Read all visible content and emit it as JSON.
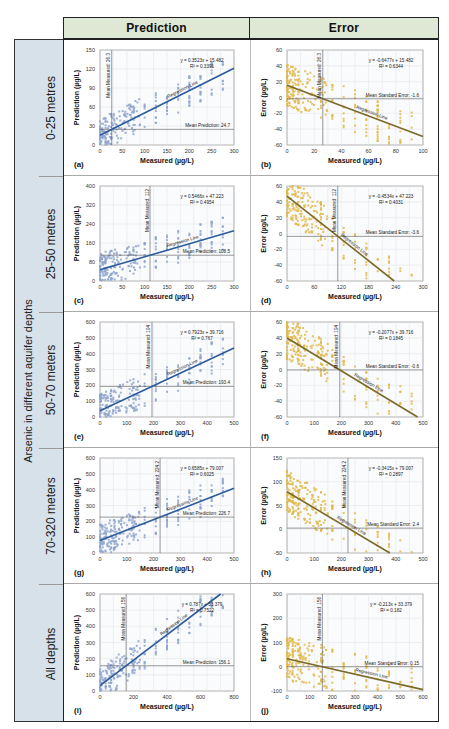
{
  "header": {
    "col1": "Prediction",
    "col2": "Error"
  },
  "sidebar": {
    "title": "Arsenic in different aquifer depths",
    "rows": [
      "0-25 metres",
      "25-50 metres",
      "50-70 meters",
      "70-320 meters",
      "All depths"
    ]
  },
  "chart_data": [
    {
      "panel": "(a)",
      "type": "scatter",
      "depth": "0-25 metres",
      "kind": "prediction",
      "xlabel": "Measured (µg/L)",
      "ylabel": "Prediction (µg/L)",
      "xlim": [
        0,
        300
      ],
      "ylim": [
        0,
        150
      ],
      "xticks": [
        0,
        50,
        100,
        150,
        200,
        250,
        300
      ],
      "yticks": [
        0,
        30,
        60,
        90,
        120,
        150
      ],
      "equation": "y = 0.3523x + 15.482",
      "r2": "R² = 0.3391",
      "slope": 0.3523,
      "intercept": 15.482,
      "mean_x_label": "Mean Measured: 26.3",
      "mean_x": 26.3,
      "mean_y_label": "Mean Prediction: 24.7",
      "mean_y": 24.7,
      "line_label": "Regression Line",
      "color": "#2e5b9a",
      "point_color": "#8ea5cc"
    },
    {
      "panel": "(b)",
      "type": "scatter",
      "depth": "0-25 metres",
      "kind": "error",
      "xlabel": "Measured (µg/L)",
      "ylabel": "Error (µg/L)",
      "xlim": [
        0,
        100
      ],
      "ylim": [
        -60,
        60
      ],
      "xticks": [
        0,
        20,
        40,
        60,
        80,
        100
      ],
      "yticks": [
        -60,
        -40,
        -20,
        0,
        20,
        40,
        60
      ],
      "equation": "y = -0.6477x + 15.482",
      "r2": "R² = 0.6344",
      "slope": -0.6477,
      "intercept": 15.482,
      "mean_x_label": "Mean Measured: 26.3",
      "mean_x": 26.3,
      "mean_y_label": "Mean Standard Error: -1.6",
      "mean_y": -1.6,
      "line_label": "Regression Line",
      "color": "#7a6a2a",
      "point_color": "#e0b94a"
    },
    {
      "panel": "(c)",
      "type": "scatter",
      "depth": "25-50 metres",
      "kind": "prediction",
      "xlabel": "Measured (µg/L)",
      "ylabel": "Prediction (µg/L)",
      "xlim": [
        0,
        300
      ],
      "ylim": [
        0,
        400
      ],
      "xticks": [
        0,
        50,
        100,
        150,
        200,
        250,
        300
      ],
      "yticks": [
        0,
        80,
        160,
        240,
        320,
        400
      ],
      "equation": "y = 0.5466x + 47.223",
      "r2": "R² = 0.4954",
      "slope": 0.5466,
      "intercept": 47.223,
      "mean_x_label": "Mean Measured: 112",
      "mean_x": 112,
      "mean_y_label": "Mean Prediction: 108.5",
      "mean_y": 108.5,
      "line_label": "Regression Line",
      "color": "#2e5b9a",
      "point_color": "#8ea5cc"
    },
    {
      "panel": "(d)",
      "type": "scatter",
      "depth": "25-50 metres",
      "kind": "error",
      "xlabel": "Measured (µg/L)",
      "ylabel": "Error (µg/L)",
      "xlim": [
        0,
        300
      ],
      "ylim": [
        -60,
        60
      ],
      "xticks": [
        0,
        60,
        120,
        180,
        240,
        300
      ],
      "yticks": [
        -60,
        -40,
        -20,
        0,
        20,
        40,
        60
      ],
      "equation": "y = -0.4534x + 47.223",
      "r2": "R² = 0.4031",
      "slope": -0.4534,
      "intercept": 47.223,
      "mean_x_label": "Mean Measured: 112",
      "mean_x": 112,
      "mean_y_label": "Mean Standard Error: -3.6",
      "mean_y": -3.6,
      "line_label": "Regression Line",
      "color": "#7a6a2a",
      "point_color": "#e0b94a"
    },
    {
      "panel": "(e)",
      "type": "scatter",
      "depth": "50-70 meters",
      "kind": "prediction",
      "xlabel": "Measured (µg/L)",
      "ylabel": "Prediction (µg/L)",
      "xlim": [
        0,
        500
      ],
      "ylim": [
        0,
        600
      ],
      "xticks": [
        0,
        100,
        200,
        300,
        400,
        500
      ],
      "yticks": [
        0,
        100,
        200,
        300,
        400,
        500,
        600
      ],
      "equation": "y = 0.7923x + 39.716",
      "r2": "R² = 0.767",
      "slope": 0.7923,
      "intercept": 39.716,
      "mean_x_label": "Mean Measured: 194",
      "mean_x": 194,
      "mean_y_label": "Mean Prediction: 193.4",
      "mean_y": 193.4,
      "line_label": "Regression Line",
      "color": "#2e5b9a",
      "point_color": "#8ea5cc"
    },
    {
      "panel": "(f)",
      "type": "scatter",
      "depth": "50-70 meters",
      "kind": "error",
      "xlabel": "Measured (µg/L)",
      "ylabel": "Error (µg/L)",
      "xlim": [
        0,
        500
      ],
      "ylim": [
        -60,
        60
      ],
      "xticks": [
        0,
        100,
        200,
        300,
        400,
        500
      ],
      "yticks": [
        -60,
        -40,
        -20,
        0,
        20,
        40,
        60
      ],
      "equation": "y = -0.2077x + 39.716",
      "r2": "R² = 0.1845",
      "slope": -0.2077,
      "intercept": 39.716,
      "mean_x_label": "Mean Measured: 194",
      "mean_x": 194,
      "mean_y_label": "Mean Standard Error: -0.6",
      "mean_y": -0.6,
      "line_label": "Regression Line",
      "color": "#7a6a2a",
      "point_color": "#e0b94a"
    },
    {
      "panel": "(g)",
      "type": "scatter",
      "depth": "70-320 meters",
      "kind": "prediction",
      "xlabel": "Measured (µg/L)",
      "ylabel": "Prediction (µg/L)",
      "xlim": [
        0,
        500
      ],
      "ylim": [
        0,
        600
      ],
      "xticks": [
        0,
        100,
        200,
        300,
        400,
        500
      ],
      "yticks": [
        0,
        100,
        200,
        300,
        400,
        500,
        600
      ],
      "equation": "y = 0.6585x + 79.007",
      "r2": "R² = 0.6025",
      "slope": 0.6585,
      "intercept": 79.007,
      "mean_x_label": "Mean Measured: 224.2",
      "mean_x": 224.2,
      "mean_y_label": "Mean Prediction: 226.7",
      "mean_y": 226.7,
      "line_label": "Regression Line",
      "color": "#2e5b9a",
      "point_color": "#8ea5cc"
    },
    {
      "panel": "(h)",
      "type": "scatter",
      "depth": "70-320 meters",
      "kind": "error",
      "xlabel": "Measured (µg/L)",
      "ylabel": "Error (µg/L)",
      "xlim": [
        0,
        500
      ],
      "ylim": [
        -50,
        150
      ],
      "xticks": [
        0,
        100,
        200,
        300,
        400,
        500
      ],
      "yticks": [
        -50,
        0,
        50,
        100,
        150
      ],
      "equation": "y = -0.3415x + 79.007",
      "r2": "R² = 0.2897",
      "slope": -0.3415,
      "intercept": 79.007,
      "mean_x_label": "Mean Measured: 224.2",
      "mean_x": 224.2,
      "mean_y_label": "Mean Standard Error: 2.4",
      "mean_y": 2.4,
      "line_label": "Regression Line",
      "color": "#7a6a2a",
      "point_color": "#e0b94a"
    },
    {
      "panel": "(i)",
      "type": "scatter",
      "depth": "All depths",
      "kind": "prediction",
      "xlabel": "Measured (µg/L)",
      "ylabel": "Prediction (µg/L)",
      "xlim": [
        0,
        800
      ],
      "ylim": [
        0,
        600
      ],
      "xticks": [
        0,
        200,
        400,
        600,
        800
      ],
      "yticks": [
        0,
        100,
        200,
        300,
        400,
        500,
        600
      ],
      "equation": "y = 0.787x + 33.379",
      "r2": "R² = 0.7522",
      "slope": 0.787,
      "intercept": 33.379,
      "mean_x_label": "Mean Measured: 156",
      "mean_x": 156,
      "mean_y_label": "Mean Prediction: 156.1",
      "mean_y": 156.1,
      "line_label": "Regression Line",
      "color": "#2e5b9a",
      "point_color": "#8ea5cc"
    },
    {
      "panel": "(j)",
      "type": "scatter",
      "depth": "All depths",
      "kind": "error",
      "xlabel": "Measured (µg/L)",
      "ylabel": "Error (µg/L)",
      "xlim": [
        0,
        600
      ],
      "ylim": [
        -100,
        300
      ],
      "xticks": [
        0,
        100,
        200,
        300,
        400,
        500,
        600
      ],
      "yticks": [
        -100,
        0,
        100,
        200,
        300
      ],
      "equation": "y = -0.213x + 33.379",
      "r2": "R² = 0.182",
      "slope": -0.213,
      "intercept": 33.379,
      "mean_x_label": "Mean Measured: 156",
      "mean_x": 156,
      "mean_y_label": "Mean Standard Error: 0.15",
      "mean_y": 0.15,
      "line_label": "Regression Line",
      "color": "#7a6a2a",
      "point_color": "#e0b94a"
    }
  ]
}
